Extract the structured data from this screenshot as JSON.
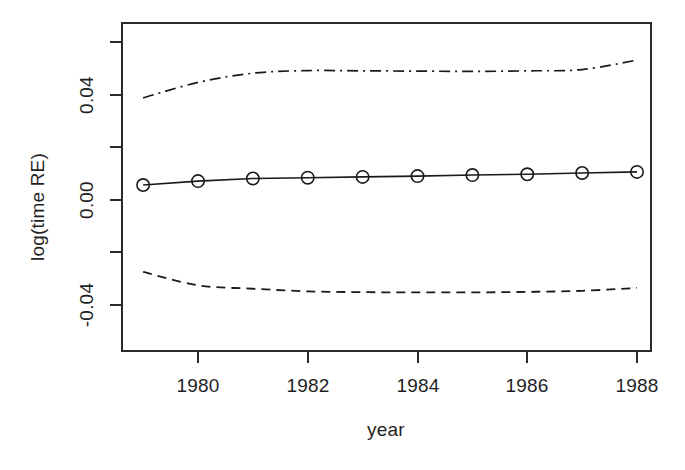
{
  "chart_data": {
    "type": "line",
    "title": "",
    "xlabel": "year",
    "ylabel": "log(time RE)",
    "xlim": [
      1978.5,
      1988.6
    ],
    "ylim": [
      -0.062,
      0.064
    ],
    "grid": false,
    "legend": "none",
    "x": [
      1979,
      1980,
      1981,
      1982,
      1983,
      1984,
      1985,
      1986,
      1987,
      1988
    ],
    "xticks": [
      1980,
      1982,
      1984,
      1986,
      1988
    ],
    "xticklabels": [
      "1980",
      "1982",
      "1984",
      "1986",
      "1988"
    ],
    "yticks": [
      -0.06,
      -0.04,
      -0.02,
      0.0,
      0.02,
      0.04,
      0.06
    ],
    "yticklabels": [
      "",
      "-0.04",
      "",
      "0.00",
      "",
      "0.04",
      ""
    ],
    "series": [
      {
        "name": "estimate",
        "style": "solid",
        "marker": "open-circle",
        "values": [
          0.0057,
          0.0072,
          0.0082,
          0.0085,
          0.0088,
          0.0091,
          0.0095,
          0.0098,
          0.0103,
          0.0107
        ]
      },
      {
        "name": "upper-confidence-bound",
        "style": "dashdot",
        "marker": "none",
        "values": [
          0.0389,
          0.0448,
          0.0483,
          0.0493,
          0.0492,
          0.0491,
          0.049,
          0.0492,
          0.0497,
          0.0533
        ]
      },
      {
        "name": "lower-confidence-bound",
        "style": "dashed",
        "marker": "none",
        "values": [
          -0.0274,
          -0.0325,
          -0.0338,
          -0.0348,
          -0.0351,
          -0.0352,
          -0.0352,
          -0.035,
          -0.0346,
          -0.0335
        ]
      }
    ]
  },
  "axes": {
    "y_label": "log(time RE)",
    "x_label": "year",
    "y_tick_labels": [
      "0.04",
      "0.00",
      "-0.04"
    ],
    "x_tick_labels": [
      "1980",
      "1982",
      "1984",
      "1986",
      "1988"
    ]
  },
  "colors": {
    "foreground": "#1a1a1a",
    "background": "#ffffff",
    "frame": "#2b2b2b"
  }
}
